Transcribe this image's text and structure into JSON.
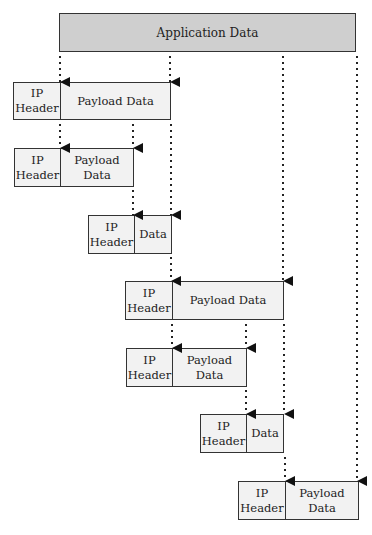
{
  "diagram": {
    "application_box": {
      "label": "Application Data",
      "x": 59,
      "y": 13,
      "w": 297,
      "h": 39
    },
    "packets": [
      {
        "level": 1,
        "header": "IP\nHeader",
        "payload": "Payload Data",
        "x": 13,
        "y": 82,
        "hw": 47,
        "pw": 111,
        "h": 38
      },
      {
        "level": 2,
        "header": "IP\nHeader",
        "payload": "Payload\nData",
        "x": 14,
        "y": 148,
        "hw": 46,
        "pw": 74,
        "h": 39
      },
      {
        "level": 3,
        "header": "IP\nHeader",
        "payload": "Data",
        "x": 88,
        "y": 215,
        "hw": 46,
        "pw": 37,
        "h": 39
      },
      {
        "level": 4,
        "header": "IP\nHeader",
        "payload": "Payload Data",
        "x": 125,
        "y": 281,
        "hw": 47,
        "pw": 111,
        "h": 39
      },
      {
        "level": 5,
        "header": "IP\nHeader",
        "payload": "Payload\nData",
        "x": 126,
        "y": 348,
        "hw": 46,
        "pw": 74,
        "h": 39
      },
      {
        "level": 6,
        "header": "IP\nHeader",
        "payload": "Data",
        "x": 200,
        "y": 414,
        "hw": 46,
        "pw": 37,
        "h": 39
      },
      {
        "level": 7,
        "header": "IP\nHeader",
        "payload": "Payload\nData",
        "x": 238,
        "y": 481,
        "hw": 47,
        "pw": 74,
        "h": 39
      }
    ],
    "colors": {
      "application_fill": "#cfcfcf",
      "packet_fill": "#f2f2f2",
      "stroke": "#333333"
    }
  }
}
